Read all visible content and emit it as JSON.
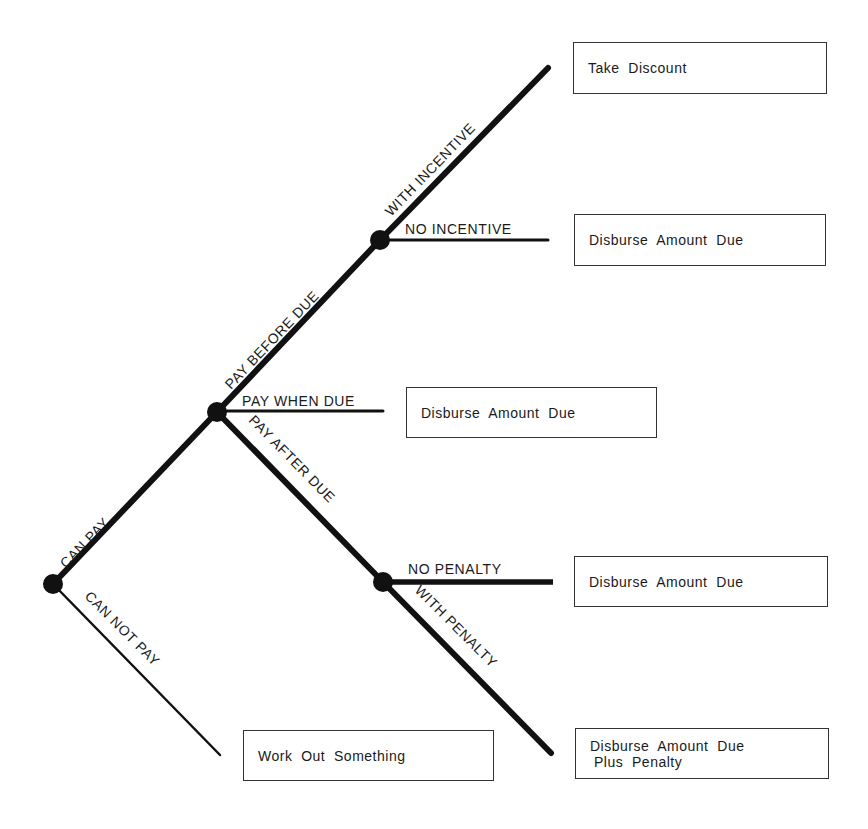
{
  "diagram": {
    "type": "decision-tree",
    "nodes": [
      {
        "id": "root",
        "x": 53,
        "y": 584
      },
      {
        "id": "can_pay",
        "x": 217,
        "y": 412
      },
      {
        "id": "pay_before_due",
        "x": 380,
        "y": 240
      },
      {
        "id": "pay_after_due",
        "x": 383,
        "y": 582
      }
    ],
    "edges": [
      {
        "from": "root",
        "label": "CAN PAY"
      },
      {
        "from": "root",
        "label": "CAN NOT PAY"
      },
      {
        "from": "can_pay",
        "label": "PAY BEFORE DUE"
      },
      {
        "from": "can_pay",
        "label": "PAY WHEN DUE"
      },
      {
        "from": "can_pay",
        "label": "PAY AFTER DUE"
      },
      {
        "from": "pay_before_due",
        "label": "WITH INCENTIVE"
      },
      {
        "from": "pay_before_due",
        "label": "NO INCENTIVE"
      },
      {
        "from": "pay_after_due",
        "label": "NO PENALTY"
      },
      {
        "from": "pay_after_due",
        "label": "WITH PENALTY"
      }
    ],
    "outcomes": [
      {
        "id": "take_discount",
        "line1": "Take  Discount",
        "line2": ""
      },
      {
        "id": "no_incentive",
        "line1": "Disburse  Amount  Due",
        "line2": ""
      },
      {
        "id": "pay_when_due",
        "line1": "Disburse  Amount  Due",
        "line2": ""
      },
      {
        "id": "no_penalty",
        "line1": "Disburse  Amount  Due",
        "line2": ""
      },
      {
        "id": "can_not_pay",
        "line1": "Work  Out  Something",
        "line2": ""
      },
      {
        "id": "with_penalty",
        "line1": "Disburse  Amount  Due",
        "line2": "Plus  Penalty"
      }
    ]
  }
}
